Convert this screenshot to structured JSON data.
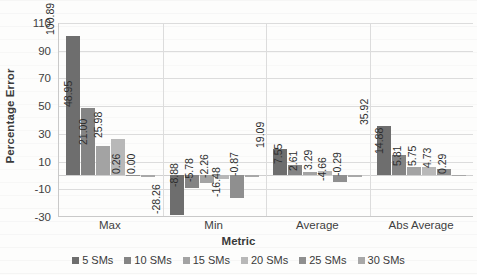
{
  "chart_data": {
    "type": "bar",
    "title": "",
    "xlabel": "Metric",
    "ylabel": "Percentage Error",
    "categories": [
      "Max",
      "Min",
      "Average",
      "Abs Average"
    ],
    "ylim": [
      -30,
      110
    ],
    "ytick_step": 20,
    "yticks": [
      110,
      90,
      70,
      50,
      30,
      10,
      -10,
      -30
    ],
    "ytick_labels": [
      "110",
      "90",
      "70",
      "50",
      "30",
      "10",
      "-10",
      "-30"
    ],
    "grid": true,
    "legend_position": "bottom",
    "series": [
      {
        "name": "5 SMs",
        "color": "#6e6e6e",
        "values": [
          100.89,
          -28.26,
          19.09,
          35.92
        ],
        "labels": [
          "100.89",
          "-28.26",
          "19.09",
          "35.92"
        ]
      },
      {
        "name": "10 SMs",
        "color": "#848484",
        "values": [
          48.95,
          -8.88,
          7.55,
          14.88
        ],
        "labels": [
          "48.95",
          "-8.88",
          "7.55",
          "14.88"
        ]
      },
      {
        "name": "15 SMs",
        "color": "#a3a3a3",
        "values": [
          21.0,
          -5.78,
          2.61,
          5.81
        ],
        "labels": [
          "21.00",
          "-5.78",
          "2.61",
          "5.81"
        ]
      },
      {
        "name": "20 SMs",
        "color": "#b8b8b8",
        "values": [
          25.98,
          -2.26,
          3.29,
          5.75
        ],
        "labels": [
          "25.98",
          "-2.26",
          "3.29",
          "5.75"
        ]
      },
      {
        "name": "25 SMs",
        "color": "#8f8f8f",
        "values": [
          0.26,
          -16.48,
          -4.66,
          4.73
        ],
        "labels": [
          "0.26",
          "-16.48",
          "-4.66",
          "4.73"
        ]
      },
      {
        "name": "30 SMs",
        "color": "#a8a8a8",
        "values": [
          0.0,
          -0.87,
          -0.29,
          0.29
        ],
        "labels": [
          "0.00",
          "-0.87",
          "-0.29",
          "0.29"
        ]
      }
    ]
  }
}
